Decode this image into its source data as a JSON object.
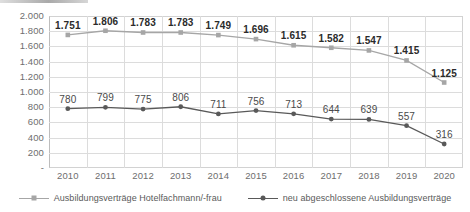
{
  "chart_data": {
    "type": "line",
    "title": "",
    "subtitle": "",
    "xlabel": "",
    "ylabel": "",
    "ylim": [
      0,
      2000
    ],
    "grid": true,
    "legend_position": "bottom",
    "categories": [
      "2010",
      "2011",
      "2012",
      "2013",
      "2014",
      "2015",
      "2016",
      "2017",
      "2018",
      "2019",
      "2020"
    ],
    "y_ticks": [
      0,
      200,
      400,
      600,
      800,
      1000,
      1200,
      1400,
      1600,
      1800,
      2000
    ],
    "y_tick_labels": [
      "-",
      "200",
      "400",
      "600",
      "800",
      "1.000",
      "1.200",
      "1.400",
      "1.600",
      "1.800",
      "2.000"
    ],
    "series": [
      {
        "name": "neu abgeschlossene Ausbildungsverträge",
        "color": "#a6a6a6",
        "marker": "square",
        "values": [
          1751,
          1806,
          1783,
          1783,
          1749,
          1696,
          1615,
          1582,
          1547,
          1415,
          1125
        ],
        "labels": [
          "1.751",
          "1.806",
          "1.783",
          "1.783",
          "1.749",
          "1.696",
          "1.615",
          "1.582",
          "1.547",
          "1.415",
          "1.125"
        ]
      },
      {
        "name": "Ausbildungsverträge Hotelfachmann/-frau",
        "color": "#595959",
        "marker": "circle",
        "values": [
          780,
          799,
          775,
          806,
          711,
          756,
          713,
          644,
          639,
          557,
          316
        ],
        "labels": [
          "780",
          "799",
          "775",
          "806",
          "711",
          "756",
          "713",
          "644",
          "639",
          "557",
          "316"
        ]
      }
    ]
  },
  "legend": {
    "items": [
      {
        "label": "Ausbildungsverträge Hotelfachmann/-frau",
        "key": "k1"
      },
      {
        "label": "neu abgeschlossene Ausbildungsverträge",
        "key": "k2"
      }
    ]
  },
  "colors": {
    "upper_series": "#a6a6a6",
    "lower_series": "#595959",
    "grid": "#dcdcdc",
    "axis_text": "#6e6e6e",
    "label_top": "#2b2b2b",
    "label_bottom": "#4a4a4a",
    "background": "#ffffff"
  }
}
